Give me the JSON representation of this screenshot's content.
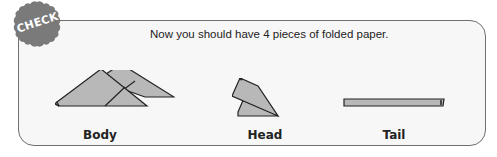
{
  "badge": {
    "label": "CHECK!",
    "color": "#7a7a7a"
  },
  "instruction": "Now you should have 4 pieces of folded paper.",
  "pieces": [
    {
      "name": "body",
      "label": "Body"
    },
    {
      "name": "head",
      "label": "Head"
    },
    {
      "name": "tail",
      "label": "Tail"
    }
  ],
  "colors": {
    "paper_fill": "#b8b8b8",
    "outline": "#222222",
    "card_border": "#6f6f6f"
  }
}
